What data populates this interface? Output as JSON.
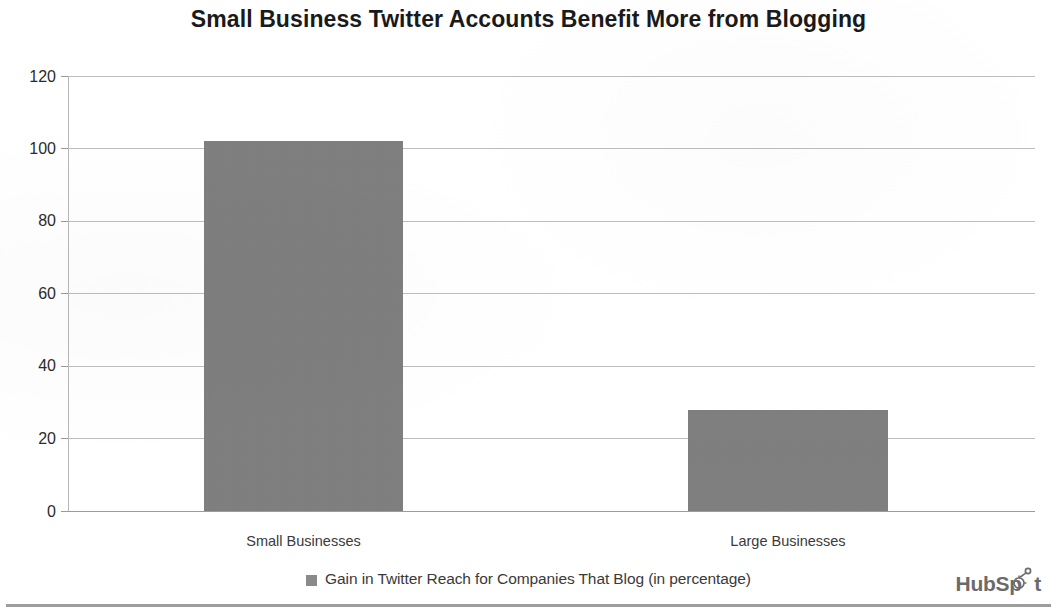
{
  "chart_data": {
    "type": "bar",
    "title": "Small Business Twitter Accounts Benefit More from Blogging",
    "categories": [
      "Small Businesses",
      "Large Businesses"
    ],
    "values": [
      102,
      28
    ],
    "series": [
      {
        "name": "Gain in Twitter Reach for Companies That Blog (in percentage)",
        "values": [
          102,
          28
        ]
      }
    ],
    "xlabel": "",
    "ylabel": "",
    "ylim": [
      0,
      120
    ],
    "yticks": [
      "0",
      "20",
      "40",
      "60",
      "80",
      "100",
      "120"
    ],
    "grid": true,
    "legend_position": "bottom",
    "bar_color": "#808080"
  },
  "legend": {
    "label": "Gain in Twitter Reach for Companies That Blog (in percentage)",
    "swatch_color": "#8a8a8a"
  },
  "branding": {
    "name": "HubSpot",
    "word_left": "HubSp",
    "word_right": "t",
    "color": "#6b6b6b"
  }
}
